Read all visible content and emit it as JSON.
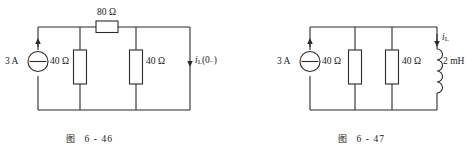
{
  "figures": [
    {
      "id": "fig-6-46",
      "caption_label": "图",
      "caption_number": "6 - 46",
      "source": {
        "value": "3 A",
        "symbol": "current-source",
        "direction": "up"
      },
      "components": [
        {
          "name": "R-80",
          "value": "80 Ω",
          "orientation": "horizontal",
          "type": "resistor"
        },
        {
          "name": "R-40-left",
          "value": "40 Ω",
          "orientation": "vertical",
          "type": "resistor"
        },
        {
          "name": "R-40-right",
          "value": "40 Ω",
          "orientation": "vertical",
          "type": "resistor"
        }
      ],
      "current_label": {
        "symbol": "i",
        "subscript": "L",
        "suffix": "(0₋)",
        "direction": "down"
      }
    },
    {
      "id": "fig-6-47",
      "caption_label": "图",
      "caption_number": "6 - 47",
      "source": {
        "value": "3 A",
        "symbol": "current-source",
        "direction": "up"
      },
      "components": [
        {
          "name": "R-40-left",
          "value": "40 Ω",
          "orientation": "vertical",
          "type": "resistor"
        },
        {
          "name": "R-40-right",
          "value": "40 Ω",
          "orientation": "vertical",
          "type": "resistor"
        },
        {
          "name": "L-2mH",
          "value": "2 mH",
          "orientation": "vertical",
          "type": "inductor"
        }
      ],
      "current_label": {
        "symbol": "i",
        "subscript": "L",
        "suffix": "",
        "direction": "down"
      }
    }
  ],
  "colors": {
    "ink": "#2b2b2b",
    "paper": "#ffffff"
  }
}
